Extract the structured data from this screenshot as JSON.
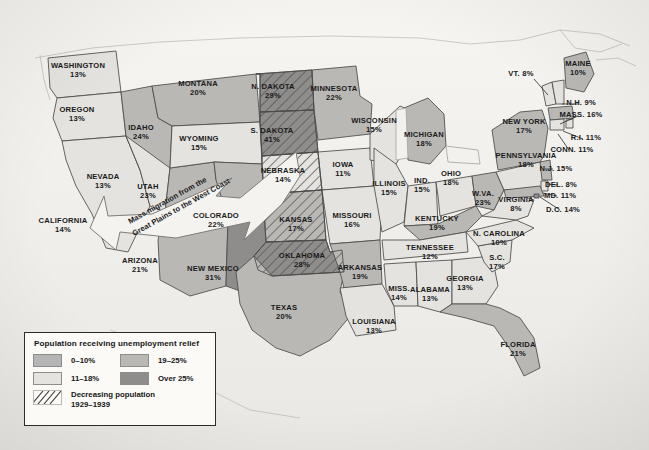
{
  "map": {
    "title": "United States unemployment relief by state, Great Depression",
    "background_color": "#f2f1ee",
    "annotation": {
      "id": "migration-arrow",
      "line1": "Mass migration from the",
      "line2": "Great Plains to the West Coast",
      "direction": "west"
    },
    "shade_colors": {
      "band_0_10": "#b5b5b5",
      "band_11_18": "#e4e3df",
      "band_19_25": "#b9b8b5",
      "band_over_25": "#8e8d8b",
      "outline": "#4a4a4a",
      "water": "#f2f1ee",
      "hatch_stroke": "#5a5a5a"
    },
    "states": [
      {
        "name": "WASHINGTON",
        "pct": "13%",
        "band": "11-18",
        "hatched": false,
        "x": 78,
        "y": 68
      },
      {
        "name": "OREGON",
        "pct": "13%",
        "band": "11-18",
        "hatched": false,
        "x": 77,
        "y": 112
      },
      {
        "name": "CALIFORNIA",
        "pct": "14%",
        "band": "11-18",
        "hatched": false,
        "x": 63,
        "y": 223
      },
      {
        "name": "NEVADA",
        "pct": "13%",
        "band": "11-18",
        "hatched": false,
        "x": 103,
        "y": 179
      },
      {
        "name": "IDAHO",
        "pct": "24%",
        "band": "19-25",
        "hatched": false,
        "x": 141,
        "y": 130
      },
      {
        "name": "UTAH",
        "pct": "23%",
        "band": "19-25",
        "hatched": false,
        "x": 148,
        "y": 189
      },
      {
        "name": "ARIZONA",
        "pct": "21%",
        "band": "19-25",
        "hatched": false,
        "x": 140,
        "y": 263
      },
      {
        "name": "NEW MEXICO",
        "pct": "31%",
        "band": "over-25",
        "hatched": false,
        "x": 213,
        "y": 271
      },
      {
        "name": "MONTANA",
        "pct": "20%",
        "band": "19-25",
        "hatched": false,
        "x": 198,
        "y": 86
      },
      {
        "name": "WYOMING",
        "pct": "15%",
        "band": "11-18",
        "hatched": false,
        "x": 199,
        "y": 141
      },
      {
        "name": "COLORADO",
        "pct": "22%",
        "band": "19-25",
        "hatched": false,
        "x": 216,
        "y": 218
      },
      {
        "name": "N. DAKOTA",
        "pct": "29%",
        "band": "over-25",
        "hatched": true,
        "x": 273,
        "y": 89
      },
      {
        "name": "S. DAKOTA",
        "pct": "41%",
        "band": "over-25",
        "hatched": true,
        "x": 272,
        "y": 133
      },
      {
        "name": "NEBRASKA",
        "pct": "14%",
        "band": "11-18",
        "hatched": true,
        "x": 283,
        "y": 173
      },
      {
        "name": "KANSAS",
        "pct": "17%",
        "band": "11-18",
        "hatched": true,
        "x": 296,
        "y": 222
      },
      {
        "name": "OKLAHOMA",
        "pct": "28%",
        "band": "over-25",
        "hatched": true,
        "x": 302,
        "y": 258
      },
      {
        "name": "TEXAS",
        "pct": "20%",
        "band": "19-25",
        "hatched": false,
        "x": 284,
        "y": 310
      },
      {
        "name": "MINNESOTA",
        "pct": "22%",
        "band": "19-25",
        "hatched": false,
        "x": 334,
        "y": 91
      },
      {
        "name": "IOWA",
        "pct": "11%",
        "band": "11-18",
        "hatched": false,
        "x": 343,
        "y": 167
      },
      {
        "name": "MISSOURI",
        "pct": "16%",
        "band": "11-18",
        "hatched": false,
        "x": 352,
        "y": 218
      },
      {
        "name": "ARKANSAS",
        "pct": "19%",
        "band": "19-25",
        "hatched": false,
        "x": 360,
        "y": 270
      },
      {
        "name": "LOUISIANA",
        "pct": "13%",
        "band": "11-18",
        "hatched": false,
        "x": 374,
        "y": 324
      },
      {
        "name": "WISCONSIN",
        "pct": "15%",
        "band": "11-18",
        "hatched": false,
        "x": 374,
        "y": 123
      },
      {
        "name": "ILLINOIS",
        "pct": "15%",
        "band": "11-18",
        "hatched": false,
        "x": 389,
        "y": 186
      },
      {
        "name": "IND.",
        "pct": "15%",
        "band": "11-18",
        "hatched": false,
        "x": 422,
        "y": 183
      },
      {
        "name": "MICHIGAN",
        "pct": "18%",
        "band": "11-18",
        "hatched": false,
        "x": 424,
        "y": 137
      },
      {
        "name": "OHIO",
        "pct": "18%",
        "band": "11-18",
        "hatched": false,
        "x": 451,
        "y": 176
      },
      {
        "name": "KENTUCKY",
        "pct": "19%",
        "band": "19-25",
        "hatched": false,
        "x": 437,
        "y": 221
      },
      {
        "name": "TENNESSEE",
        "pct": "12%",
        "band": "11-18",
        "hatched": false,
        "x": 430,
        "y": 250
      },
      {
        "name": "MISS.",
        "pct": "14%",
        "band": "11-18",
        "hatched": false,
        "x": 399,
        "y": 291
      },
      {
        "name": "ALABAMA",
        "pct": "13%",
        "band": "11-18",
        "hatched": false,
        "x": 430,
        "y": 292
      },
      {
        "name": "GEORGIA",
        "pct": "13%",
        "band": "11-18",
        "hatched": false,
        "x": 465,
        "y": 281
      },
      {
        "name": "FLORIDA",
        "pct": "21%",
        "band": "19-25",
        "hatched": false,
        "x": 518,
        "y": 347
      },
      {
        "name": "S.C.",
        "pct": "17%",
        "band": "11-18",
        "hatched": false,
        "x": 497,
        "y": 260
      },
      {
        "name": "N. CAROLINA",
        "pct": "10%",
        "band": "11-18",
        "hatched": false,
        "x": 499,
        "y": 236
      },
      {
        "name": "W.VA.",
        "pct": "23%",
        "band": "19-25",
        "hatched": false,
        "x": 483,
        "y": 196
      },
      {
        "name": "VIRGINIA",
        "pct": "8%",
        "band": "11-18",
        "hatched": false,
        "x": 516,
        "y": 202
      },
      {
        "name": "PENNSYLVANIA",
        "pct": "18%",
        "band": "11-18",
        "hatched": false,
        "x": 526,
        "y": 158
      },
      {
        "name": "NEW YORK",
        "pct": "17%",
        "band": "19-25",
        "hatched": false,
        "x": 524,
        "y": 124
      },
      {
        "name": "MAINE",
        "pct": "10%",
        "band": "11-18",
        "hatched": false,
        "x": 578,
        "y": 66
      }
    ],
    "leader_labels": [
      {
        "name": "VT. 8%",
        "x": 521,
        "y": 76,
        "anchor": "end",
        "lx1": 534,
        "ly1": 79,
        "lx2": 548,
        "ly2": 95
      },
      {
        "name": "N.H. 9%",
        "x": 581,
        "y": 105,
        "anchor": "start",
        "lx1": 562,
        "ly1": 104,
        "lx2": 578,
        "ly2": 104
      },
      {
        "name": "MASS. 16%",
        "x": 581,
        "y": 117,
        "anchor": "start",
        "lx1": 560,
        "ly1": 124,
        "lx2": 578,
        "ly2": 116
      },
      {
        "name": "R.I. 11%",
        "x": 586,
        "y": 140,
        "anchor": "start",
        "lx1": 563,
        "ly1": 131,
        "lx2": 583,
        "ly2": 139
      },
      {
        "name": "CONN. 11%",
        "x": 572,
        "y": 152,
        "anchor": "start",
        "lx1": 558,
        "ly1": 134,
        "lx2": 569,
        "ly2": 150
      },
      {
        "name": "N.J. 15%",
        "x": 556,
        "y": 171,
        "anchor": "start",
        "lx1": 545,
        "ly1": 169,
        "lx2": 553,
        "ly2": 169
      },
      {
        "name": "DEL. 8%",
        "x": 561,
        "y": 187,
        "anchor": "start",
        "lx1": 547,
        "ly1": 184,
        "lx2": 558,
        "ly2": 185
      },
      {
        "name": "MD. 11%",
        "x": 560,
        "y": 198,
        "anchor": "start",
        "lx1": 543,
        "ly1": 193,
        "lx2": 557,
        "ly2": 196
      },
      {
        "name": "D.C. 14%",
        "x": 563,
        "y": 212,
        "anchor": "start",
        "lx1": 540,
        "ly1": 197,
        "lx2": 560,
        "ly2": 210
      }
    ]
  },
  "legend": {
    "title": "Population receiving unemployment relief",
    "items": [
      {
        "label": "0–10%",
        "color": "#b5b5b5"
      },
      {
        "label": "19–25%",
        "color": "#b9b8b5"
      },
      {
        "label": "11–18%",
        "color": "#e4e3df"
      },
      {
        "label": "Over 25%",
        "color": "#8e8d8b"
      }
    ],
    "hatch": {
      "line1": "Decreasing population",
      "line2": "1929–1939"
    }
  }
}
